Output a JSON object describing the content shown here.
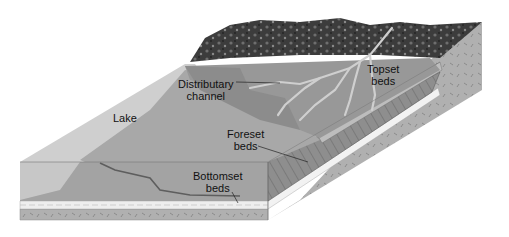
{
  "diagram": {
    "labels": {
      "lake": "Lake",
      "distributary_line1": "Distributary",
      "distributary_line2": "channel",
      "topset_line1": "Topset",
      "topset_line2": "beds",
      "foreset_line1": "Foreset",
      "foreset_line2": "beds",
      "bottomset_line1": "Bottomset",
      "bottomset_line2": "beds"
    },
    "colors": {
      "background": "#ffffff",
      "lake_water": "#d9d9d9",
      "lake_floor": "#a6a6a6",
      "delta_plain": "#9a9a9a",
      "mountains": "#3a3a3a",
      "bedrock": "#b3b3b3",
      "bottomset_layer": "#eeeeee",
      "channel": "#c8c8c8",
      "text": "#111111"
    }
  }
}
